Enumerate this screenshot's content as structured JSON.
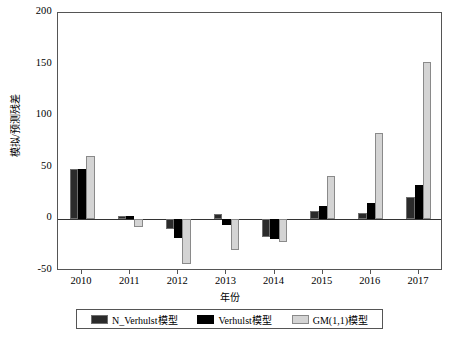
{
  "chart_data": {
    "type": "bar",
    "title": "",
    "xlabel": "年份",
    "ylabel": "模拟/预测残差",
    "categories": [
      "2010",
      "2011",
      "2012",
      "2013",
      "2014",
      "2015",
      "2016",
      "2017"
    ],
    "ylim": [
      -50,
      200
    ],
    "yticks": [
      -50,
      0,
      50,
      100,
      150,
      200
    ],
    "ytick_labels": [
      "-50",
      "0",
      "50",
      "100",
      "150",
      "200"
    ],
    "grid": false,
    "legend_position": "bottom",
    "series": [
      {
        "name": "N_Verhulst模型",
        "color": "#2b2b2b",
        "values": [
          49,
          3,
          -9,
          5,
          -17,
          8,
          6,
          22
        ]
      },
      {
        "name": "Verhulst模型",
        "color": "#000000",
        "values": [
          49,
          3,
          -18,
          -5,
          -19,
          13,
          16,
          33
        ]
      },
      {
        "name": "GM(1,1)模型",
        "color": "#d4d4d4",
        "values": [
          61,
          -7,
          -43,
          -30,
          -22,
          42,
          84,
          153
        ]
      }
    ]
  },
  "caption": ""
}
